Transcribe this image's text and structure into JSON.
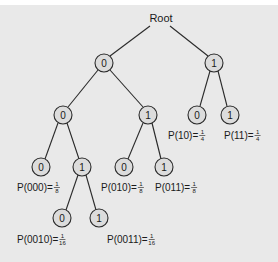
{
  "diagram": {
    "title": "Root",
    "nodes": [
      {
        "id": "n0",
        "label": "0",
        "x": 104,
        "y": 63
      },
      {
        "id": "n1",
        "label": "1",
        "x": 214,
        "y": 63
      },
      {
        "id": "n00",
        "label": "0",
        "x": 63,
        "y": 115
      },
      {
        "id": "n01",
        "label": "1",
        "x": 148,
        "y": 115
      },
      {
        "id": "n10",
        "label": "0",
        "x": 197,
        "y": 115
      },
      {
        "id": "n11",
        "label": "1",
        "x": 230,
        "y": 115
      },
      {
        "id": "n000",
        "label": "0",
        "x": 41,
        "y": 167
      },
      {
        "id": "n001",
        "label": "1",
        "x": 82,
        "y": 167
      },
      {
        "id": "n010",
        "label": "0",
        "x": 124,
        "y": 167
      },
      {
        "id": "n011",
        "label": "1",
        "x": 164,
        "y": 167
      },
      {
        "id": "n0010",
        "label": "0",
        "x": 62,
        "y": 218
      },
      {
        "id": "n0011",
        "label": "1",
        "x": 99,
        "y": 218
      }
    ],
    "probabilities": [
      {
        "text": "P(10)=",
        "num": "1",
        "den": "4",
        "x": 168,
        "y": 139
      },
      {
        "text": "P(11)=",
        "num": "1",
        "den": "4",
        "x": 224,
        "y": 139
      },
      {
        "text": "P(000)=",
        "num": "1",
        "den": "8",
        "x": 17,
        "y": 191
      },
      {
        "text": "P(010)=",
        "num": "1",
        "den": "8",
        "x": 101,
        "y": 191
      },
      {
        "text": "P(011)=",
        "num": "1",
        "den": "8",
        "x": 155,
        "y": 191
      },
      {
        "text": "P(0010)=",
        "num": "1",
        "den": "16",
        "x": 17,
        "y": 243
      },
      {
        "text": "P(0011)=",
        "num": "1",
        "den": "16",
        "x": 107,
        "y": 243
      }
    ]
  }
}
